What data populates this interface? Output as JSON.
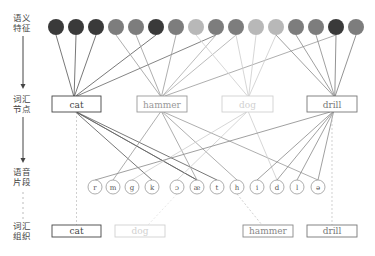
{
  "levels": [
    {
      "line1": "语义",
      "line2": "特征"
    },
    {
      "line1": "词汇",
      "line2": "节点"
    },
    {
      "line1": "语音",
      "line2": "片段"
    },
    {
      "line1": "词汇",
      "line2": "组织"
    }
  ],
  "semantic_features": [
    {
      "shade": "#3a3a3a"
    },
    {
      "shade": "#3a3a3a"
    },
    {
      "shade": "#3a3a3a"
    },
    {
      "shade": "#7d7d7d"
    },
    {
      "shade": "#7d7d7d"
    },
    {
      "shade": "#3a3a3a"
    },
    {
      "shade": "#7d7d7d"
    },
    {
      "shade": "#b8b8b8"
    },
    {
      "shade": "#7d7d7d"
    },
    {
      "shade": "#7d7d7d"
    },
    {
      "shade": "#b8b8b8"
    },
    {
      "shade": "#b8b8b8"
    },
    {
      "shade": "#7d7d7d"
    },
    {
      "shade": "#7d7d7d"
    },
    {
      "shade": "#3a3a3a"
    },
    {
      "shade": "#7d7d7d"
    }
  ],
  "lexical_nodes": [
    {
      "label": "cat",
      "color": "#444444"
    },
    {
      "label": "hammer",
      "color": "#999999"
    },
    {
      "label": "dog",
      "color": "#d0d0d0"
    },
    {
      "label": "drill",
      "color": "#777777"
    }
  ],
  "phonemes": [
    "r",
    "m",
    "g",
    "k",
    "ɔ",
    "æ",
    "t",
    "h",
    "i",
    "d",
    "l",
    "ə"
  ],
  "lexical_organization": [
    {
      "label": "cat",
      "color": "#444444"
    },
    {
      "label": "dog",
      "color": "#d0d0d0"
    },
    {
      "label": "hammer",
      "color": "#888888"
    },
    {
      "label": "drill",
      "color": "#777777"
    }
  ]
}
